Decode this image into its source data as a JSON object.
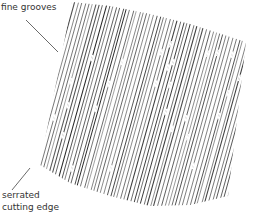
{
  "labels": {
    "grooves": "fine grooves",
    "edge_line1": "serrated",
    "edge_line2": "cutting edge"
  },
  "colors": {
    "background": "#ffffff",
    "line": "#222222",
    "text": "#333333"
  },
  "patch": {
    "outline": [
      [
        72,
        2
      ],
      [
        110,
        6
      ],
      [
        150,
        14
      ],
      [
        190,
        24
      ],
      [
        246,
        42
      ],
      [
        228,
        196
      ],
      [
        190,
        205
      ],
      [
        150,
        206
      ],
      [
        110,
        196
      ],
      [
        70,
        183
      ],
      [
        40,
        165
      ]
    ],
    "line_count": 70,
    "slant_dx": 60
  },
  "leaders": {
    "grooves": {
      "x1": 26,
      "y1": 20,
      "x2": 58,
      "y2": 52
    },
    "edge": {
      "x1": 12,
      "y1": 190,
      "x2": 30,
      "y2": 168
    }
  }
}
